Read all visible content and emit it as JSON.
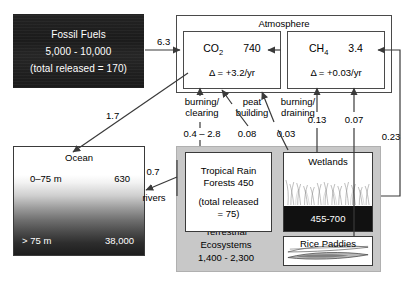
{
  "reservoirs": {
    "fossil_fuels": {
      "title": "Fossil Fuels",
      "amount": "5,000 - 10,000",
      "released": "(total released = 170)"
    },
    "atmosphere": {
      "title": "Atmosphere",
      "co2": {
        "name": "CO",
        "subscript": "2",
        "value": "740",
        "delta": "Δ = +3.2/yr"
      },
      "ch4": {
        "name": "CH",
        "subscript": "4",
        "value": "3.4",
        "delta": "Δ = +0.03/yr"
      }
    },
    "ocean": {
      "title": "Ocean",
      "shallow_label": "0–75 m",
      "shallow_value": "630",
      "deep_label": "> 75 m",
      "deep_value": "38,000"
    },
    "terrestrial": {
      "line1": "Terrestrial",
      "line2": "Ecosystems",
      "line3": "1,400 - 2,300"
    },
    "rain_forests": {
      "line1": "Tropical Rain",
      "line2": "Forests 450",
      "line3": "(total released",
      "line4": "= 75)"
    },
    "wetlands": {
      "title": "Wetlands",
      "value": "455-700"
    },
    "rice_paddies": {
      "title": "Rice Paddies"
    }
  },
  "flows": {
    "fossil_to_atmosphere": "6.3",
    "atmosphere_to_ocean": "1.7",
    "rivers_value": "0.7",
    "rivers_label": "rivers",
    "burning_clearing_l1": "burning/",
    "burning_clearing_l2": "clearing",
    "burning_clearing_value": "0.4 – 2.8",
    "peat_l1": "peat",
    "peat_l2": "building",
    "peat_value": "0.08",
    "burning_draining_l1": "burning/",
    "burning_draining_l2": "draining",
    "burning_draining_value": "0.03",
    "wetlands_flux": "0.13",
    "rice_flux": "0.07",
    "terrestrial_flux": "0.23"
  },
  "colors": {
    "stroke": "#4a4a4a",
    "fossil_fill": "#1e1e1e",
    "terrestrial_fill": "#c8c8c8",
    "soil_fill": "#111111",
    "paper": "#ffffff"
  }
}
